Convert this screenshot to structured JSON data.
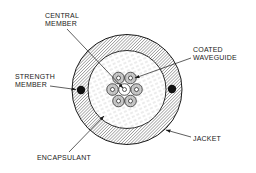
{
  "diagram": {
    "type": "cable-cross-section",
    "colors": {
      "line": "#1a1a1a",
      "jacket_hatch": "#555555",
      "encapsulant_hatch": "#b5b5b5",
      "waveguide_fill": "#c8c8c8",
      "strength_member": "#111111",
      "background": "#ffffff"
    },
    "labels": {
      "central_member": [
        "CENTRAL",
        "MEMBER"
      ],
      "coated_waveguide": [
        "COATED",
        "WAVEGUIDE"
      ],
      "strength_member": [
        "STRENGTH",
        "MEMBER"
      ],
      "jacket": "JACKET",
      "encapsulant": "ENCAPSULANT"
    },
    "components": [
      {
        "id": "jacket",
        "shape": "ring",
        "cx": 127,
        "cy": 89.5,
        "r_outer": 55,
        "r_inner": 39
      },
      {
        "id": "encapsulant",
        "shape": "disc",
        "cx": 127,
        "cy": 89.5,
        "r": 39
      },
      {
        "id": "strength-member-left",
        "shape": "dot",
        "cx": 81,
        "cy": 90,
        "r": 4.2
      },
      {
        "id": "strength-member-right",
        "shape": "dot",
        "cx": 172,
        "cy": 89,
        "r": 4.2
      },
      {
        "id": "waveguide-bundle",
        "count": 7,
        "arrangement": "hexagonal",
        "center_is_central_member": true
      }
    ]
  }
}
